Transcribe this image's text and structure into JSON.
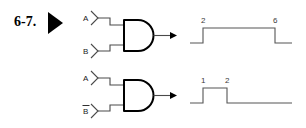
{
  "exercise": {
    "number_label": "6-7.",
    "marker_icon": "play-triangle-icon"
  },
  "circuits": [
    {
      "id": "circuit-top",
      "gate_type": "AND",
      "inputs": [
        {
          "label": "A",
          "inverted": false
        },
        {
          "label": "B",
          "inverted": false
        }
      ],
      "output": {
        "label": "",
        "arrow": true
      }
    },
    {
      "id": "circuit-bottom",
      "gate_type": "AND",
      "inputs": [
        {
          "label": "A",
          "inverted": false
        },
        {
          "label": "B",
          "inverted": true
        }
      ],
      "output": {
        "label": "",
        "arrow": true
      }
    }
  ],
  "waveforms": [
    {
      "id": "waveform-top",
      "rise_label": "2",
      "fall_label": "6"
    },
    {
      "id": "waveform-bottom",
      "rise_label": "1",
      "fall_label": "2"
    }
  ],
  "colors": {
    "ink": "#000000",
    "wire": "#4a4a4a",
    "wave": "#555555",
    "background": "#ffffff"
  }
}
